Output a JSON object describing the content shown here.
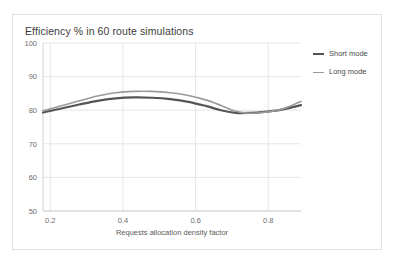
{
  "card": {
    "title": "Efficiency % in 60 route simulations"
  },
  "legend": {
    "items": [
      {
        "label": "Short mode",
        "color": "#555555",
        "thickness": 2.2
      },
      {
        "label": "Long mode",
        "color": "#9a9a9a",
        "thickness": 1.6
      }
    ]
  },
  "chart_data": {
    "type": "line",
    "title": "Efficiency % in 60 route simulations",
    "xlabel": "Requests allocation density factor",
    "ylabel": "",
    "xlim": [
      0.18,
      0.89
    ],
    "ylim": [
      50,
      100
    ],
    "xticks": [
      0.2,
      0.4,
      0.6,
      0.8
    ],
    "xtick_labels": [
      "0.2",
      "0.4",
      "0.6",
      "0.8"
    ],
    "yticks": [
      50,
      60,
      70,
      80,
      90,
      100
    ],
    "ytick_labels": [
      "50",
      "60",
      "70",
      "80",
      "90",
      "100"
    ],
    "grid": true,
    "grid_axis": "both",
    "legend_position": "right",
    "series": [
      {
        "name": "Short mode",
        "color": "#555555",
        "x": [
          0.18,
          0.23,
          0.28,
          0.33,
          0.38,
          0.43,
          0.48,
          0.53,
          0.58,
          0.63,
          0.67,
          0.71,
          0.75,
          0.79,
          0.83,
          0.86,
          0.89
        ],
        "values": [
          79.3,
          80.5,
          81.7,
          82.8,
          83.5,
          83.8,
          83.7,
          83.3,
          82.5,
          81.2,
          80.0,
          79.2,
          79.2,
          79.5,
          80.0,
          80.7,
          81.5
        ]
      },
      {
        "name": "Long mode",
        "color": "#9a9a9a",
        "x": [
          0.18,
          0.23,
          0.28,
          0.33,
          0.38,
          0.43,
          0.48,
          0.53,
          0.58,
          0.63,
          0.67,
          0.71,
          0.75,
          0.79,
          0.83,
          0.86,
          0.89
        ],
        "values": [
          79.8,
          81.3,
          82.8,
          84.2,
          85.2,
          85.6,
          85.6,
          85.2,
          84.4,
          83.0,
          81.4,
          79.7,
          79.1,
          79.4,
          80.1,
          81.2,
          82.6
        ]
      }
    ]
  }
}
